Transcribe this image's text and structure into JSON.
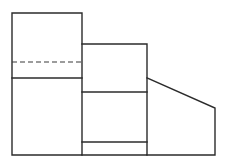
{
  "document": {
    "title": "Orthographic Projection View",
    "background_color": "#ffffff",
    "line_color": "#2b2b2b",
    "hidden_line_color": "#3a3a3a",
    "canvas": {
      "width": 228,
      "height": 166
    }
  },
  "chart_data": {
    "type": "line",
    "xlabel": "",
    "ylabel": "",
    "xlim": [
      0,
      228
    ],
    "ylim": [
      166,
      0
    ],
    "grid": false,
    "legend": false,
    "series": [
      {
        "name": "left-block-outline",
        "style": "visible-edge",
        "x": [
          12,
          82,
          82,
          12,
          12
        ],
        "y": [
          13,
          13,
          155,
          155,
          13
        ]
      },
      {
        "name": "middle-block-outline",
        "style": "visible-edge",
        "x": [
          82,
          147,
          147,
          82
        ],
        "y": [
          44,
          44,
          155,
          155
        ]
      },
      {
        "name": "right-chamfer-block-outline",
        "style": "visible-edge",
        "x": [
          147,
          215,
          215,
          147
        ],
        "y": [
          78,
          108,
          155,
          155
        ]
      },
      {
        "name": "left-block-hidden-line",
        "style": "hidden-edge",
        "x": [
          12,
          82
        ],
        "y": [
          62,
          62
        ]
      },
      {
        "name": "left-block-step-line",
        "style": "visible-edge",
        "x": [
          12,
          82
        ],
        "y": [
          78,
          78
        ]
      },
      {
        "name": "middle-block-upper-division",
        "style": "visible-edge",
        "x": [
          82,
          147
        ],
        "y": [
          92,
          92
        ]
      },
      {
        "name": "middle-block-lower-division",
        "style": "visible-edge",
        "x": [
          82,
          147
        ],
        "y": [
          142,
          142
        ]
      }
    ]
  }
}
